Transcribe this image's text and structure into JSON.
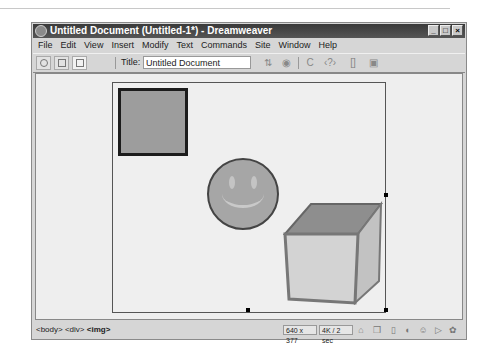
{
  "window": {
    "title": "Untitled Document (Untitled-1*) - Dreamweaver",
    "controls": [
      "minimize",
      "maximize",
      "close"
    ]
  },
  "menubar": {
    "items": [
      "File",
      "Edit",
      "View",
      "Insert",
      "Modify",
      "Text",
      "Commands",
      "Site",
      "Window",
      "Help"
    ]
  },
  "toolbar": {
    "view_buttons": [
      {
        "name": "show-code-view",
        "icon": "code-view-icon"
      },
      {
        "name": "show-code-and-design-views",
        "icon": "split-view-icon"
      },
      {
        "name": "show-design-view",
        "icon": "design-view-icon",
        "active": true
      }
    ],
    "title_label": "Title:",
    "title_value": "Untitled Document",
    "icons": [
      "file-management-icon",
      "preview-browser-icon",
      "refresh-icon",
      "code-navigation-icon",
      "reference-icon",
      "view-options-icon"
    ],
    "icon_glyphs": [
      "⇅",
      "◉",
      "C",
      "‹?›",
      "[]",
      "▣"
    ]
  },
  "document": {
    "images": [
      "square",
      "smiley-face",
      "cube"
    ]
  },
  "statusbar": {
    "tag_selector": [
      "<body>",
      "<div>",
      "<img>"
    ],
    "window_size": "640 x 377",
    "download_stats": "4K / 2 sec",
    "launcher_icons": [
      "site-icon",
      "assets-icon",
      "html-styles-icon",
      "css-styles-icon",
      "behaviors-icon",
      "history-icon",
      "code-inspector-icon"
    ],
    "launcher_glyphs": [
      "⌂",
      "❒",
      "▯",
      "◐",
      "☺",
      "▷",
      "✿"
    ]
  }
}
